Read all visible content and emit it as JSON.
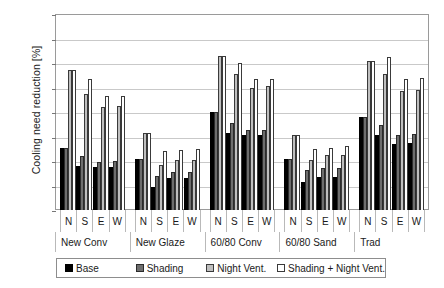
{
  "chart_data": {
    "type": "bar",
    "title": "",
    "xlabel": "",
    "ylabel": "Cooling need reduction [%]",
    "ylim": [
      0,
      80
    ],
    "ytick_labels": [
      "80%",
      "70%",
      "60%",
      "50%",
      "40%",
      "30%",
      "20%",
      "10%",
      "0%"
    ],
    "ytick_values": [
      80,
      70,
      60,
      50,
      40,
      30,
      20,
      10,
      0
    ],
    "grid": true,
    "legend_position": "bottom",
    "orientations": [
      "N",
      "S",
      "E",
      "W"
    ],
    "categories": [
      "New Conv",
      "New Glaze",
      "60/80 Conv",
      "60/80 Sand",
      "Trad"
    ],
    "series": [
      {
        "name": "Base",
        "fill": "#000000",
        "values": [
          [
            25.5,
            18.0,
            17.5,
            17.5
          ],
          [
            21.0,
            9.5,
            13.0,
            13.0
          ],
          [
            40.0,
            31.5,
            30.5,
            30.5
          ],
          [
            21.0,
            11.5,
            13.5,
            13.5
          ],
          [
            38.0,
            30.5,
            27.0,
            27.5
          ]
        ]
      },
      {
        "name": "Shading",
        "fill": "#6e6e6e",
        "values": [
          [
            25.5,
            22.0,
            19.5,
            20.0
          ],
          [
            21.0,
            14.0,
            15.5,
            15.5
          ],
          [
            40.0,
            35.5,
            32.5,
            32.5
          ],
          [
            21.0,
            16.5,
            17.0,
            17.0
          ],
          [
            38.0,
            34.5,
            30.5,
            31.0
          ]
        ]
      },
      {
        "name": "Night Vent.",
        "fill": "#bfbfbf",
        "values": [
          [
            57.0,
            47.5,
            42.0,
            42.5
          ],
          [
            31.5,
            18.5,
            20.5,
            20.5
          ],
          [
            63.0,
            55.5,
            50.0,
            50.5
          ],
          [
            30.5,
            20.5,
            22.5,
            22.5
          ],
          [
            61.0,
            55.5,
            48.5,
            49.0
          ]
        ]
      },
      {
        "name": "Shading + Night Vent.",
        "fill": "#ffffff",
        "values": [
          [
            57.0,
            53.5,
            46.5,
            46.5
          ],
          [
            31.5,
            24.0,
            24.5,
            25.0
          ],
          [
            63.0,
            60.0,
            53.5,
            53.5
          ],
          [
            30.5,
            25.0,
            25.5,
            26.0
          ],
          [
            61.0,
            62.5,
            53.5,
            54.0
          ]
        ]
      }
    ]
  },
  "legend": {
    "items": [
      {
        "label": "Base"
      },
      {
        "label": "Shading"
      },
      {
        "label": "Night Vent."
      },
      {
        "label": "Shading + Night Vent."
      }
    ]
  }
}
